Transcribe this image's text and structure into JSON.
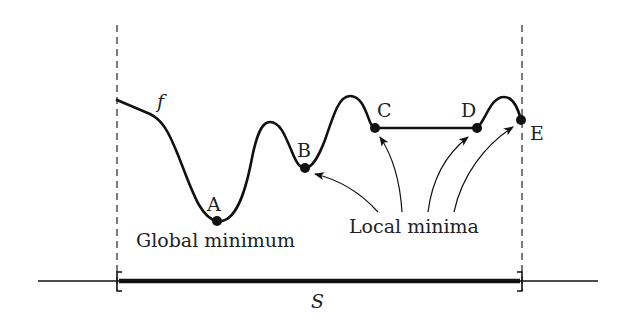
{
  "diagram": {
    "function_label": "f",
    "set_label": "S",
    "points": [
      {
        "label": "A",
        "x": 217,
        "y": 221
      },
      {
        "label": "B",
        "x": 305,
        "y": 168
      },
      {
        "label": "C",
        "x": 375,
        "y": 128
      },
      {
        "label": "D",
        "x": 477,
        "y": 128
      },
      {
        "label": "E",
        "x": 521,
        "y": 120
      }
    ],
    "annotations": {
      "global": "Global minimum",
      "local": "Local minima"
    },
    "colors": {
      "ink": "#111111",
      "background": "#ffffff"
    }
  }
}
